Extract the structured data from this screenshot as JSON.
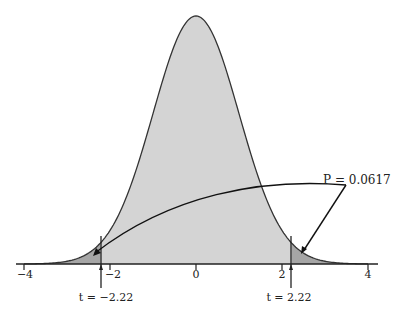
{
  "chart_data": {
    "type": "area",
    "title": "",
    "xlabel": "",
    "ylabel": "",
    "xlim": [
      -4,
      4
    ],
    "x_ticks": [
      -4,
      -2,
      0,
      2,
      4
    ],
    "x_tick_labels": [
      "−4",
      "−2",
      "0",
      "2",
      "4"
    ],
    "distribution": "t (approximately standard normal)",
    "critical_values": [
      -2.22,
      2.22
    ],
    "critical_labels": [
      "t = −2.22",
      "t = 2.22"
    ],
    "p_value_label": "P = 0.0617",
    "p_value": 0.0617,
    "shaded_tails": [
      {
        "from": -4,
        "to": -2.22
      },
      {
        "from": 2.22,
        "to": 4
      }
    ],
    "colors": {
      "body": "#d4d4d4",
      "tails": "#a6a6a6",
      "line": "#333333"
    },
    "grid": false,
    "legend": null
  },
  "labels": {
    "ticks": [
      "−4",
      "−2",
      "0",
      "2",
      "4"
    ],
    "t_left": "t = −2.22",
    "t_right": "t = 2.22",
    "p": "P = 0.0617"
  }
}
